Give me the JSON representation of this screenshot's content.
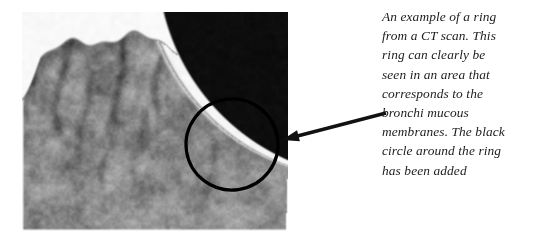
{
  "figure": {
    "kind": "ct-scan-image",
    "modality_label": "CT scan",
    "alt": "Grayscale CT scan slice of a head showing brain gyri and sulci with a dark air space at the upper right",
    "colors": {
      "tissue_mid": "#8d8d8d",
      "tissue_light": "#b9b9b9",
      "tissue_dark": "#5a5a5a",
      "sulcus": "#3d3d3d",
      "air_black": "#0b0b0b",
      "bone_white": "#fbfbfb",
      "background": "#ffffff"
    }
  },
  "annotations": {
    "circle": {
      "name": "black circle around the ring",
      "color": "#000000",
      "stroke_width": 3.2,
      "cx": 232,
      "cy": 144.5,
      "rx": 46,
      "ry": 45.5,
      "rotation": -8
    },
    "arrow": {
      "name": "pointer arrow from caption to circle",
      "color": "#111111",
      "stroke_width": 3.4,
      "tail_x": 386,
      "tail_y": 113,
      "tip_x": 282,
      "tip_y": 140
    }
  },
  "caption": {
    "text": "An example of a ring from a CT scan. This ring can clearly be seen in an area that corresponds to the bronchi mucous membranes. The black circle around the ring has been added",
    "lines": [
      "An example of a ring",
      "from a CT scan. This",
      "ring can clearly be",
      "seen in an area that",
      "corresponds to the",
      "bronchi mucous",
      "membranes. The black",
      "circle around the ring",
      "has been added"
    ]
  }
}
